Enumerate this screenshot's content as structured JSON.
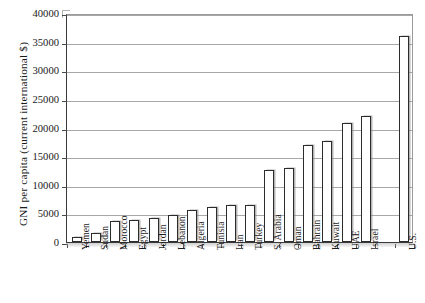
{
  "chart_data": {
    "type": "bar",
    "title": "",
    "xlabel": "",
    "ylabel": "GNI per capita  (current  international  $)",
    "ylim": [
      0,
      40000
    ],
    "ytick_step": 5000,
    "yticks": [
      "0",
      "5000",
      "10000",
      "15000",
      "20000",
      "25000",
      "30000",
      "35000",
      "40000"
    ],
    "grid": "horizontal",
    "legend": "none",
    "bar_fill_color": "#ffffff",
    "bar_edge_color": "#2c2c2c",
    "categories": [
      "Yemen",
      "Sudan",
      "Morocco",
      "Egypt",
      "Jordan",
      "Lebanon",
      "Algeria",
      "Tunisia",
      "Iran",
      "Turkey",
      "S. Arabia",
      "Oman",
      "Bahrain",
      "Kuwait",
      "UAE",
      "Israel",
      "",
      "U.S."
    ],
    "values": [
      800,
      1600,
      3700,
      3900,
      4200,
      4800,
      5600,
      6200,
      6400,
      6400,
      12600,
      12900,
      16900,
      17700,
      20800,
      22000,
      null,
      36000
    ]
  }
}
